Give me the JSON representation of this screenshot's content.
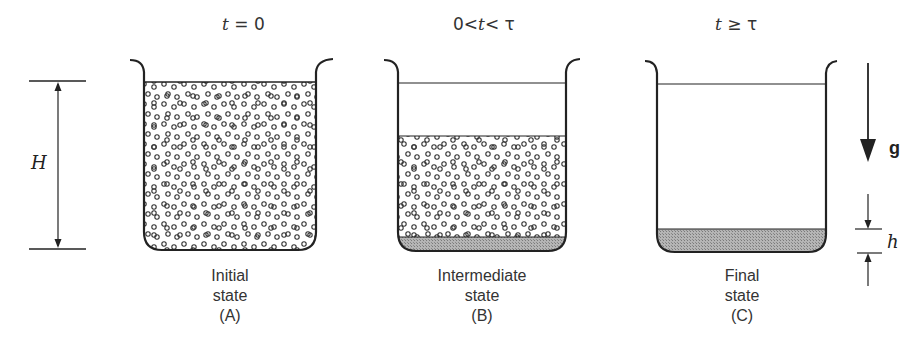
{
  "figure": {
    "panels": [
      {
        "id": "A",
        "time_label_pre": "",
        "time_var": "t",
        "time_label_post": " = 0",
        "caption_line1": "Initial",
        "caption_line2": "state",
        "caption_line3": "(A)"
      },
      {
        "id": "B",
        "time_label_pre": "0<",
        "time_var": "t",
        "time_label_post": "< τ",
        "caption_line1": "Intermediate",
        "caption_line2": "state",
        "caption_line3": "(B)"
      },
      {
        "id": "C",
        "time_label_pre": "",
        "time_var": "t",
        "time_label_post": " ≥ τ",
        "caption_line1": "Final",
        "caption_line2": "state",
        "caption_line3": "(C)"
      }
    ],
    "dimension_H": "H",
    "dimension_h": "h",
    "gravity_label": "g",
    "colors": {
      "line": "#222222",
      "sediment": "#9a9a9a",
      "particle": "#333333"
    }
  }
}
